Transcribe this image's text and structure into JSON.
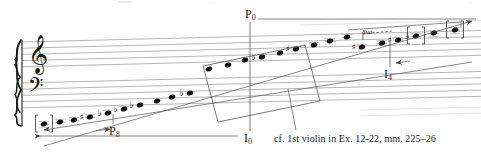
{
  "figure": {
    "type": "music-notation-diagram",
    "ink_color": "#1a1a1a",
    "overlay_color": "#555555",
    "staff_color": "#6a6a6a"
  },
  "labels": {
    "p0": {
      "base": "P",
      "sub": "0"
    },
    "p8": {
      "base": "P",
      "sub": "8"
    },
    "i0": {
      "base": "I",
      "sub": "0"
    },
    "i4": {
      "base": "I",
      "sub": "4"
    },
    "ottava": "8va"
  },
  "caption": "cf. 1st violin in Ex. 12-22, mm. 225–26",
  "clefs": [
    {
      "name": "treble-clef",
      "glyph": "𝄞"
    },
    {
      "name": "bass-clef",
      "glyph": "𝄢"
    }
  ],
  "staves": [
    {
      "name": "upper-staff",
      "top": 42,
      "line_gap": 6.2,
      "x_start": 22,
      "x_end": 481
    },
    {
      "name": "lower-staff",
      "top": 83,
      "line_gap": 6.2,
      "x_start": 22,
      "x_end": 481
    }
  ],
  "note_row": {
    "count": 24,
    "notes": [
      {
        "i": 0,
        "x": 44,
        "y": 124,
        "accidental": "",
        "ledgers": 3,
        "bracketed": true
      },
      {
        "i": 1,
        "x": 60,
        "y": 122,
        "accidental": "",
        "ledgers": 2,
        "bracketed": false
      },
      {
        "i": 2,
        "x": 74,
        "y": 120,
        "accidental": "",
        "ledgers": 2,
        "bracketed": false
      },
      {
        "i": 3,
        "x": 90,
        "y": 117,
        "accidental": "♯",
        "ledgers": 2,
        "bracketed": false
      },
      {
        "i": 4,
        "x": 108,
        "y": 113,
        "accidental": "♭",
        "ledgers": 1,
        "bracketed": false
      },
      {
        "i": 5,
        "x": 124,
        "y": 109,
        "accidental": "♭",
        "ledgers": 1,
        "bracketed": false
      },
      {
        "i": 6,
        "x": 140,
        "y": 105,
        "accidental": "♭",
        "ledgers": 0,
        "bracketed": false
      },
      {
        "i": 7,
        "x": 157,
        "y": 101,
        "accidental": "",
        "ledgers": 0,
        "bracketed": false
      },
      {
        "i": 8,
        "x": 172,
        "y": 97,
        "accidental": "",
        "ledgers": 0,
        "bracketed": false
      },
      {
        "i": 9,
        "x": 190,
        "y": 93,
        "accidental": "♭",
        "ledgers": 0,
        "bracketed": false
      },
      {
        "i": 10,
        "x": 209,
        "y": 69,
        "accidental": "",
        "ledgers": 0,
        "bracketed": false
      },
      {
        "i": 11,
        "x": 228,
        "y": 65,
        "accidental": "",
        "ledgers": 0,
        "bracketed": false
      },
      {
        "i": 12,
        "x": 245,
        "y": 60,
        "accidental": "",
        "ledgers": 0,
        "bracketed": false
      },
      {
        "i": 13,
        "x": 262,
        "y": 57,
        "accidental": "♭",
        "ledgers": 0,
        "bracketed": false
      },
      {
        "i": 14,
        "x": 280,
        "y": 53,
        "accidental": "",
        "ledgers": 0,
        "bracketed": false
      },
      {
        "i": 15,
        "x": 296,
        "y": 49,
        "accidental": "♯",
        "ledgers": 1,
        "bracketed": false
      },
      {
        "i": 16,
        "x": 314,
        "y": 45,
        "accidental": "",
        "ledgers": 1,
        "bracketed": false
      },
      {
        "i": 17,
        "x": 330,
        "y": 41,
        "accidental": "",
        "ledgers": 2,
        "bracketed": false
      },
      {
        "i": 18,
        "x": 347,
        "y": 37,
        "accidental": "",
        "ledgers": 2,
        "bracketed": false
      },
      {
        "i": 19,
        "x": 362,
        "y": 47,
        "accidental": "♯",
        "ledgers": 1,
        "bracketed": false
      },
      {
        "i": 20,
        "x": 382,
        "y": 43,
        "accidental": "",
        "ledgers": 2,
        "bracketed": false
      },
      {
        "i": 21,
        "x": 398,
        "y": 40,
        "accidental": "♯",
        "ledgers": 2,
        "bracketed": false
      },
      {
        "i": 22,
        "x": 416,
        "y": 36,
        "accidental": "♭",
        "ledgers": 2,
        "bracketed": true
      },
      {
        "i": 23,
        "x": 434,
        "y": 33,
        "accidental": "",
        "ledgers": 3,
        "bracketed": false
      },
      {
        "i": 24,
        "x": 455,
        "y": 30,
        "accidental": "",
        "ledgers": 3,
        "bracketed": true
      }
    ]
  },
  "overlay": {
    "parallelogram": {
      "points": "203,66 305,45 320,101 218,122"
    },
    "p0_axis": {
      "x": 250,
      "y_top": 16,
      "y_bottom": 132
    },
    "p0_rule": {
      "x1": 258,
      "y1": 18,
      "x2": 474,
      "y2": 18
    },
    "i0_rule": {
      "x1": 232,
      "y1": 136,
      "x2": 40,
      "y2": 136
    },
    "i4_axis": {
      "x": 390,
      "y_top": 40,
      "y_bottom": 66
    },
    "caption_leader": {
      "x1": 296,
      "y1": 131,
      "x2": 288,
      "y2": 88
    },
    "diag_up": {
      "x1": 44,
      "y1": 145,
      "x2": 470,
      "y2": 22
    },
    "diag_down": {
      "x1": 44,
      "y1": 128,
      "x2": 470,
      "y2": 60
    }
  }
}
